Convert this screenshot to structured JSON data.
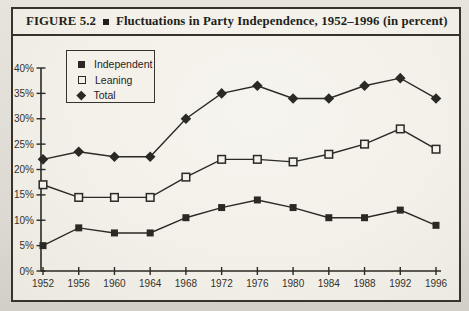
{
  "figure": {
    "label": "FIGURE 5.2",
    "bullet": "■",
    "title": "Fluctuations in Party Independence, 1952–1996 (in percent)"
  },
  "colors": {
    "ink": "#2b2923",
    "paper": "#f4f1ea",
    "page_background": "#ddd9d2"
  },
  "chart_data": {
    "type": "line",
    "title": "Fluctuations in Party Independence, 1952–1996 (in percent)",
    "categories": [
      "1952",
      "1956",
      "1960",
      "1964",
      "1968",
      "1972",
      "1976",
      "1980",
      "1984",
      "1988",
      "1992",
      "1996"
    ],
    "series": [
      {
        "name": "Independent",
        "marker": "filled-square",
        "values": [
          5,
          8.5,
          7.5,
          7.5,
          10.5,
          12.5,
          14,
          12.5,
          10.5,
          10.5,
          12,
          9
        ]
      },
      {
        "name": "Leaning",
        "marker": "open-square",
        "values": [
          17,
          14.5,
          14.5,
          14.5,
          18.5,
          22,
          22,
          21.5,
          23,
          25,
          28,
          24
        ]
      },
      {
        "name": "Total",
        "marker": "filled-diamond",
        "values": [
          22,
          23.5,
          22.5,
          22.5,
          30,
          35,
          36.5,
          34,
          34,
          36.5,
          38,
          34
        ]
      }
    ],
    "ylim": [
      0,
      40
    ],
    "ytick_step": 5,
    "ytick_suffix": "%",
    "xlabel": "",
    "ylabel": "",
    "grid": false,
    "legend_position": "upper-left-inside",
    "legend_order": [
      "Independent",
      "Leaning",
      "Total"
    ]
  }
}
